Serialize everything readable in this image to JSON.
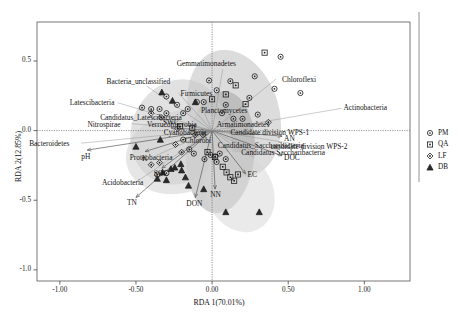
{
  "chart_data": {
    "type": "scatter",
    "title": "",
    "xlabel": "RDA 1(70.01%)",
    "ylabel": "RDA 2(12.85%)",
    "xlim": [
      -1.15,
      1.3
    ],
    "ylim": [
      -1.08,
      0.78
    ],
    "xticks": [
      "-1.00",
      "-0.50",
      "0.00",
      "0.50",
      "1.00"
    ],
    "xtick_values": [
      -1.0,
      -0.5,
      0.0,
      0.5,
      1.0
    ],
    "yticks": [
      "0.5",
      "0.0",
      "-0.5",
      "-1.0"
    ],
    "ytick_values": [
      0.5,
      0.0,
      -0.5,
      -1.0
    ],
    "grid": false,
    "legend_position": "right-outside",
    "legend": [
      {
        "label": "PM",
        "marker": "circle"
      },
      {
        "label": "QA",
        "marker": "square"
      },
      {
        "label": "LF",
        "marker": "diamond"
      },
      {
        "label": "DB",
        "marker": "triangle"
      }
    ],
    "taxa_labels": [
      {
        "text": "Gemmatimonadetes",
        "x": 0.07,
        "y": 0.44
      },
      {
        "text": "Chloroflexi",
        "x": 0.42,
        "y": 0.37
      },
      {
        "text": "Bacteria_unclassified",
        "x": -0.43,
        "y": 0.32
      },
      {
        "text": "Firmicutes",
        "x": -0.22,
        "y": 0.27
      },
      {
        "text": "Latescibacteria",
        "x": -0.62,
        "y": 0.2
      },
      {
        "text": "Candidatus_Latescibacteria",
        "x": -0.42,
        "y": 0.1
      },
      {
        "text": "Nitrospirae",
        "x": -0.53,
        "y": 0.05
      },
      {
        "text": "Planctomycetes",
        "x": -0.06,
        "y": 0.15
      },
      {
        "text": "Verrucomicrobia",
        "x": -0.23,
        "y": 0.05
      },
      {
        "text": "Armatimonadetes",
        "x": 0.07,
        "y": 0.05
      },
      {
        "text": "Cyanobacteria",
        "x": -0.16,
        "y": -0.01
      },
      {
        "text": "Chlorobi",
        "x": -0.1,
        "y": -0.07
      },
      {
        "text": "Candidate division WPS-1",
        "x": 0.16,
        "y": -0.01
      },
      {
        "text": "Actinobacteria",
        "x": 0.85,
        "y": 0.16
      },
      {
        "text": "candidate division WPS-2",
        "x": 0.62,
        "y": -0.11
      },
      {
        "text": "Candidatus_Saccharibacteria",
        "x": 0.13,
        "y": -0.1
      },
      {
        "text": "Candidatus Saccharibacteria",
        "x": 0.27,
        "y": -0.15
      },
      {
        "text": "Bacteroidetes",
        "x": -0.86,
        "y": -0.09
      },
      {
        "text": "Proteobacteria",
        "x": -0.37,
        "y": -0.18
      },
      {
        "text": "Acidobacteria",
        "x": -0.5,
        "y": -0.37
      }
    ],
    "env_vectors": [
      {
        "text": "pH",
        "x": -0.82,
        "y": -0.14
      },
      {
        "text": "K",
        "x": -0.44,
        "y": -0.15
      },
      {
        "text": "SWC",
        "x": -0.27,
        "y": 0.02
      },
      {
        "text": "SOC",
        "x": -0.33,
        "y": -0.27
      },
      {
        "text": "TN",
        "x": -0.5,
        "y": -0.48
      },
      {
        "text": "DON",
        "x": -0.11,
        "y": -0.48
      },
      {
        "text": "NN",
        "x": 0.02,
        "y": -0.42
      },
      {
        "text": "EC",
        "x": 0.22,
        "y": -0.31
      },
      {
        "text": "DOC",
        "x": 0.46,
        "y": -0.18
      },
      {
        "text": "AN",
        "x": 0.46,
        "y": -0.04
      }
    ],
    "series": [
      {
        "name": "PM",
        "marker": "circle",
        "points": [
          [
            -0.3,
            0.245
          ],
          [
            -0.46,
            0.165
          ],
          [
            -0.4,
            0.155
          ],
          [
            -0.345,
            0.155
          ],
          [
            -0.3,
            0.125
          ],
          [
            -0.23,
            0.185
          ],
          [
            -0.19,
            0.125
          ],
          [
            -0.16,
            0.155
          ],
          [
            -0.1,
            0.205
          ],
          [
            -0.055,
            0.205
          ],
          [
            -0.02,
            0.36
          ],
          [
            0.03,
            0.29
          ],
          [
            0.065,
            0.125
          ],
          [
            0.09,
            0.185
          ],
          [
            0.12,
            0.355
          ],
          [
            0.14,
            0.085
          ],
          [
            0.2,
            0.085
          ],
          [
            0.245,
            0.235
          ],
          [
            0.28,
            0.39
          ],
          [
            0.3,
            0.115
          ],
          [
            0.41,
            0.3
          ],
          [
            0.45,
            0.53
          ],
          [
            0.58,
            0.27
          ],
          [
            -0.19,
            -0.065
          ],
          [
            -0.15,
            -0.135
          ],
          [
            -0.12,
            -0.165
          ],
          [
            -0.05,
            -0.205
          ],
          [
            -0.01,
            -0.175
          ],
          [
            0.03,
            -0.225
          ],
          [
            0.05,
            -0.165
          ],
          [
            0.09,
            -0.205
          ],
          [
            -0.36,
            -0.315
          ],
          [
            -0.3,
            -0.305
          ]
        ]
      },
      {
        "name": "QA",
        "marker": "square",
        "points": [
          [
            -0.21,
            0.03
          ],
          [
            -0.13,
            0.02
          ],
          [
            0.0,
            0.225
          ],
          [
            0.09,
            0.26
          ],
          [
            0.155,
            0.325
          ],
          [
            0.22,
            0.19
          ],
          [
            0.345,
            0.56
          ],
          [
            0.02,
            -0.19
          ],
          [
            0.07,
            -0.26
          ],
          [
            0.095,
            -0.3
          ],
          [
            0.12,
            -0.335
          ],
          [
            0.145,
            -0.36
          ],
          [
            0.17,
            -0.315
          ],
          [
            -0.03,
            -0.155
          ]
        ]
      },
      {
        "name": "LF",
        "marker": "diamond",
        "points": [
          [
            -0.4,
            0.125
          ],
          [
            -0.335,
            0.095
          ],
          [
            -0.225,
            0.015
          ],
          [
            -0.11,
            -0.03
          ],
          [
            -0.06,
            -0.03
          ],
          [
            0.37,
            0.06
          ],
          [
            -0.24,
            -0.1
          ],
          [
            -0.2,
            -0.155
          ],
          [
            -0.345,
            -0.23
          ],
          [
            -0.4,
            -0.245
          ],
          [
            0.02,
            -0.185
          ]
        ]
      },
      {
        "name": "DB",
        "marker": "triangle",
        "points": [
          [
            -0.33,
            0.275
          ],
          [
            -0.26,
            0.215
          ],
          [
            -0.11,
            0.205
          ],
          [
            -0.34,
            -0.065
          ],
          [
            -0.5,
            -0.115
          ],
          [
            -0.205,
            -0.24
          ],
          [
            -0.27,
            -0.275
          ],
          [
            -0.325,
            -0.3
          ],
          [
            -0.36,
            -0.345
          ],
          [
            -0.3,
            -0.355
          ],
          [
            -0.245,
            -0.265
          ],
          [
            -0.2,
            -0.285
          ],
          [
            -0.175,
            -0.335
          ],
          [
            -0.155,
            -0.395
          ],
          [
            -0.055,
            -0.42
          ],
          [
            0.09,
            -0.585
          ],
          [
            0.31,
            -0.585
          ]
        ]
      }
    ],
    "ellipses": [
      {
        "group": "PM",
        "cx": 0.145,
        "cy": 0.125,
        "rx": 0.295,
        "ry": 0.465,
        "rot": -17,
        "fill": "#b9b9b9",
        "opacity": 0.5
      },
      {
        "group": "QA",
        "cx": 0.055,
        "cy": -0.155,
        "rx": 0.225,
        "ry": 0.44,
        "rot": 5,
        "fill": "#9a9a9a",
        "opacity": 0.45
      },
      {
        "group": "LF",
        "cx": -0.225,
        "cy": -0.01,
        "rx": 0.305,
        "ry": 0.385,
        "rot": 22,
        "fill": "#c9c9c9",
        "opacity": 0.55
      },
      {
        "group": "DB",
        "cx": -0.215,
        "cy": -0.155,
        "rx": 0.355,
        "ry": 0.295,
        "rot": -14,
        "fill": "#d2d2d2",
        "opacity": 0.55
      },
      {
        "group": "extra",
        "cx": 0.18,
        "cy": -0.44,
        "rx": 0.22,
        "ry": 0.3,
        "rot": -26,
        "fill": "#d6d6d6",
        "opacity": 0.5
      }
    ]
  },
  "axes": {
    "x_title": "RDA 1(70.01%)",
    "y_title": "RDA 2(12.85%)"
  }
}
